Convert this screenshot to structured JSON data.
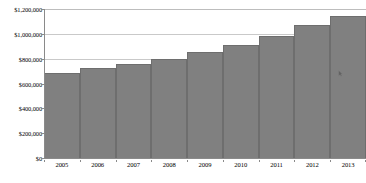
{
  "chart_data": {
    "type": "bar",
    "title": "",
    "subtitle": "",
    "xlabel": "",
    "ylabel": "",
    "categories": [
      "2005",
      "2006",
      "2007",
      "2008",
      "2009",
      "2010",
      "2011",
      "2012",
      "2013"
    ],
    "values": [
      685000,
      725000,
      757000,
      797000,
      854000,
      910000,
      983000,
      1071000,
      1144000
    ],
    "series": [
      {
        "name": "",
        "values": [
          685000,
          725000,
          757000,
          797000,
          854000,
          910000,
          983000,
          1071000,
          1144000
        ]
      }
    ],
    "ylim": [
      0,
      1200000
    ],
    "ytick_values": [
      0,
      200000,
      400000,
      600000,
      800000,
      1000000,
      1200000
    ],
    "ytick_labels": [
      "$0",
      "$200,000",
      "$400,000",
      "$600,000",
      "$800,000",
      "$1,000,000",
      "$1,200,000"
    ],
    "xtick_labels": [
      "2005",
      "2006",
      "2007",
      "2008",
      "2009",
      "2010",
      "2011",
      "2012",
      "2013"
    ],
    "grid": true,
    "grid_axis": "y",
    "legend": false,
    "legend_position": "none",
    "bar_color": "#808080",
    "bar_edge_color": "#6e6e6e",
    "gridline_color": "#c9c9c9",
    "axis_color": "#8a8a8a",
    "background_color": "#ffffff",
    "text_color": "#000000",
    "annotations": []
  },
  "overlay": {
    "cursor_name": "mouse-cursor-artifact"
  }
}
